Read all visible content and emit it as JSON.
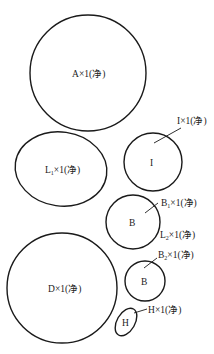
{
  "diagram": {
    "type": "cutting-layout-parts",
    "line_color": "#1a1a1a",
    "text_color": "#222222",
    "parts": [
      {
        "id": "A",
        "shape": "circle",
        "label_main": "A",
        "label_sub": "",
        "label_suffix": "×1(净)",
        "inner_text": ""
      },
      {
        "id": "L1",
        "shape": "ellipse",
        "label_main": "L",
        "label_sub": "1",
        "label_suffix": "×1(净)",
        "inner_text": ""
      },
      {
        "id": "I",
        "shape": "circle",
        "label_main": "I",
        "label_sub": "",
        "label_suffix": "×1(净)",
        "inner_text": "I"
      },
      {
        "id": "B1",
        "shape": "circle",
        "label_main": "B",
        "label_sub": "1",
        "label_suffix": "×1(净)",
        "inner_text": "B"
      },
      {
        "id": "L2",
        "shape": "none",
        "label_main": "L",
        "label_sub": "2",
        "label_suffix": "×1(净)",
        "inner_text": ""
      },
      {
        "id": "D",
        "shape": "circle",
        "label_main": "D",
        "label_sub": "",
        "label_suffix": "×1(净)",
        "inner_text": ""
      },
      {
        "id": "B2",
        "shape": "circle",
        "label_main": "B",
        "label_sub": "2",
        "label_suffix": "×1(净)",
        "inner_text": "B"
      },
      {
        "id": "H",
        "shape": "ellipse",
        "label_main": "H",
        "label_sub": "",
        "label_suffix": "×1(净)",
        "inner_text": "H"
      }
    ]
  }
}
